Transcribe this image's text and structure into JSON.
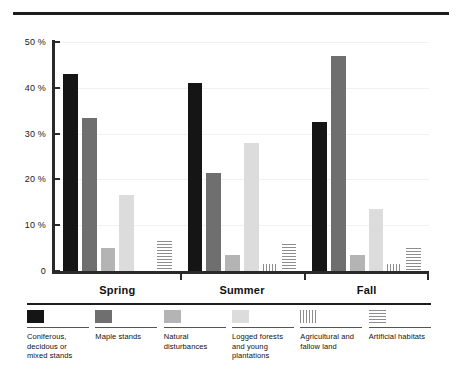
{
  "chart_data": {
    "type": "bar",
    "title": "",
    "xlabel": "",
    "ylabel": "",
    "categories": [
      "Spring",
      "Summer",
      "Fall"
    ],
    "ylim": [
      0,
      50
    ],
    "yticks": [
      0,
      10,
      20,
      30,
      40,
      50
    ],
    "ytick_labels": [
      "0",
      "10 %",
      "20 %",
      "30 %",
      "40 %",
      "50 %"
    ],
    "grid": true,
    "legend_position": "bottom",
    "series": [
      {
        "name": "Coniferous, decidous or mixed stands",
        "fill": "f-black",
        "color": "#151515",
        "values": [
          43,
          41,
          32.5
        ]
      },
      {
        "name": "Maple stands",
        "fill": "f-darkgray",
        "color": "#6f6f6f",
        "values": [
          33.5,
          21.5,
          47
        ]
      },
      {
        "name": "Natural disturbances",
        "fill": "f-midgray",
        "color": "#b4b4b4",
        "values": [
          5,
          3.5,
          3.5
        ]
      },
      {
        "name": "Logged forests and young plantations",
        "fill": "f-lightgray",
        "color": "#dcdcdc",
        "values": [
          16.5,
          28,
          13.5
        ]
      },
      {
        "name": "Agricultural and fallow land",
        "fill": "f-vstripe",
        "color": "#8d8d8d",
        "values": [
          0,
          1.5,
          1.5
        ]
      },
      {
        "name": "Artificial habitats",
        "fill": "f-hstripe",
        "color": "#8d8d8d",
        "values": [
          6.5,
          6,
          5
        ]
      }
    ]
  },
  "legend": [
    {
      "label": "Coniferous, decidous or mixed stands",
      "swatch": "solid-black-swatch"
    },
    {
      "label": "Maple stands",
      "swatch": "solid-dark-gray-swatch"
    },
    {
      "label": "Natural disturbances",
      "swatch": "solid-mid-gray-swatch"
    },
    {
      "label": "Logged forests and young plantations",
      "swatch": "solid-light-gray-swatch"
    },
    {
      "label": "Agricultural and fallow land",
      "swatch": "vertical-stripe-swatch"
    },
    {
      "label": "Artificial habitats",
      "swatch": "horizontal-stripe-swatch"
    }
  ]
}
